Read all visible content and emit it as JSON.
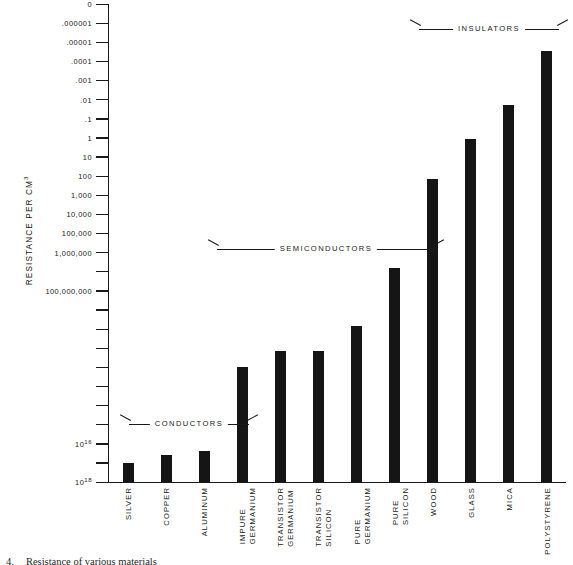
{
  "chart_data": {
    "type": "bar",
    "title": "",
    "xlabel": "",
    "ylabel": "RESISTANCE PER CM",
    "ylabel_sup": "3",
    "yscale": "log",
    "ylim": [
      1e-07,
      1e+18
    ],
    "grid": false,
    "legend": "none",
    "categories": [
      "SILVER",
      "COPPER",
      "ALUMINUM",
      "IMPURE GERMANIUM",
      "TRANSISTOR GERMANIUM",
      "TRANSISTOR SILICON",
      "PURE GERMANIUM",
      "PURE SILICON",
      "WOOD",
      "GLASS",
      "MICA",
      "POLYSTYRENE"
    ],
    "values": [
      1.5e-06,
      4e-06,
      6e-06,
      0.12,
      1.6,
      1.6,
      22,
      50000,
      100000000,
      13000000000,
      5000000000000,
      10000000000000000
    ],
    "value_labels": [
      ".0000015",
      ".000004",
      ".000006",
      ".12",
      "1.6",
      "1.6",
      "22",
      "50,000",
      "100,000,000",
      "13,000,000,000",
      "5,000,000,000,000",
      "10^16"
    ],
    "ytick_labels": [
      "10^18",
      "",
      "10^16",
      "",
      "",
      "",
      "",
      "",
      "",
      "",
      "100,000,000",
      "",
      "1,000,000",
      "100,000",
      "10,000",
      "1,000",
      "100",
      "10",
      "1",
      ".1",
      ".01",
      ".001",
      ".0001",
      ".00001",
      ".000001",
      "0"
    ],
    "groups": [
      {
        "label": "CONDUCTORS",
        "from": 0,
        "to": 2
      },
      {
        "label": "SEMICONDUCTORS",
        "from": 3,
        "to": 7
      },
      {
        "label": "INSULATORS",
        "from": 8,
        "to": 11
      }
    ]
  },
  "axis": {
    "title_text": "RESISTANCE  PER  CM",
    "title_sup": "3"
  },
  "yticks": [
    {
      "label": "10",
      "sup": "18",
      "major": true
    },
    {
      "label": "",
      "sup": "",
      "major": false
    },
    {
      "label": "10",
      "sup": "16",
      "major": true
    },
    {
      "label": "",
      "sup": "",
      "major": false
    },
    {
      "label": "",
      "sup": "",
      "major": false
    },
    {
      "label": "",
      "sup": "",
      "major": false
    },
    {
      "label": "",
      "sup": "",
      "major": false
    },
    {
      "label": "",
      "sup": "",
      "major": false
    },
    {
      "label": "",
      "sup": "",
      "major": false
    },
    {
      "label": "",
      "sup": "",
      "major": false
    },
    {
      "label": "100,000,000",
      "sup": "",
      "major": true
    },
    {
      "label": "",
      "sup": "",
      "major": false
    },
    {
      "label": "1,000,000",
      "sup": "",
      "major": true
    },
    {
      "label": "100,000",
      "sup": "",
      "major": true
    },
    {
      "label": "10,000",
      "sup": "",
      "major": true
    },
    {
      "label": "1,000",
      "sup": "",
      "major": true
    },
    {
      "label": "100",
      "sup": "",
      "major": true
    },
    {
      "label": "10",
      "sup": "",
      "major": true
    },
    {
      "label": "1",
      "sup": "",
      "major": true
    },
    {
      "label": ".1",
      "sup": "",
      "major": true
    },
    {
      "label": ".01",
      "sup": "",
      "major": true
    },
    {
      "label": ".001",
      "sup": "",
      "major": true
    },
    {
      "label": ".0001",
      "sup": "",
      "major": true
    },
    {
      "label": ".00001",
      "sup": "",
      "major": true
    },
    {
      "label": ".000001",
      "sup": "",
      "major": true
    },
    {
      "label": "0",
      "sup": "",
      "major": true
    }
  ],
  "bars": [
    {
      "name": "silver",
      "line1": "SILVER",
      "line2": "",
      "top_px": 460.0
    },
    {
      "name": "copper",
      "line1": "COPPER",
      "line2": "",
      "top_px": 452.0
    },
    {
      "name": "aluminum",
      "line1": "ALUMINUM",
      "line2": "",
      "top_px": 448.0
    },
    {
      "name": "impure-germanium",
      "line1": "IMPURE",
      "line2": "GERMANIUM",
      "top_px": 364.0
    },
    {
      "name": "transistor-germanium",
      "line1": "TRANSISTOR",
      "line2": "GERMANIUM",
      "top_px": 348.0
    },
    {
      "name": "transistor-silicon",
      "line1": "TRANSISTOR",
      "line2": "SILICON",
      "top_px": 348.0
    },
    {
      "name": "pure-germanium",
      "line1": "PURE",
      "line2": "GERMANIUM",
      "top_px": 323.0
    },
    {
      "name": "pure-silicon",
      "line1": "PURE",
      "line2": "SILICON",
      "top_px": 265.0
    },
    {
      "name": "wood",
      "line1": "WOOD",
      "line2": "",
      "top_px": 176.0
    },
    {
      "name": "glass",
      "line1": "GLASS",
      "line2": "",
      "top_px": 136.0
    },
    {
      "name": "mica",
      "line1": "MICA",
      "line2": "",
      "top_px": 102.0
    },
    {
      "name": "polystyrene",
      "line1": "POLYSTYRENE",
      "line2": "",
      "top_px": 48.0
    }
  ],
  "groups": [
    {
      "name": "conductors",
      "label": "CONDUCTORS",
      "left_px": 10,
      "width_px": 140,
      "top_px": 415
    },
    {
      "name": "semiconductors",
      "label": "SEMICONDUCTORS",
      "left_px": 98,
      "width_px": 238,
      "top_px": 240
    },
    {
      "name": "insulators",
      "label": "INSULATORS",
      "left_px": 300,
      "width_px": 160,
      "top_px": 20
    }
  ],
  "caption": {
    "number": "4.",
    "text": "Resistance of various materials"
  }
}
